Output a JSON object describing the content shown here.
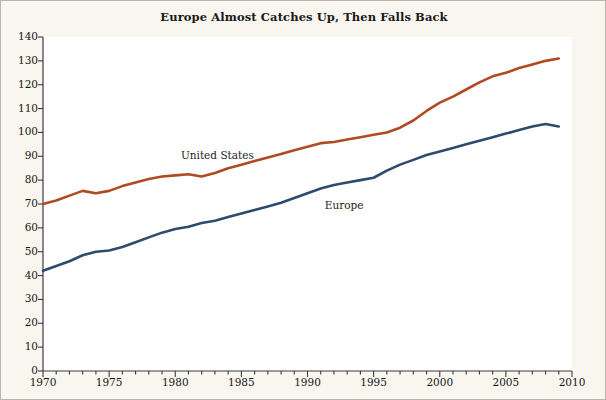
{
  "chart_data": {
    "type": "line",
    "title": "Europe Almost Catches Up, Then Falls Back",
    "xlabel": "",
    "ylabel": "",
    "xlim": [
      1970,
      2010
    ],
    "ylim": [
      0,
      140
    ],
    "ytick_step": 10,
    "xtick_step": 5,
    "x_minor_tick_step": 1,
    "grid": false,
    "legend": "inline-series-labels",
    "yticks": [
      0,
      10,
      20,
      30,
      40,
      50,
      60,
      70,
      80,
      90,
      100,
      110,
      120,
      130,
      140
    ],
    "xticks": [
      1970,
      1975,
      1980,
      1985,
      1990,
      1995,
      2000,
      2005,
      2010
    ],
    "x": [
      1970,
      1971,
      1972,
      1973,
      1974,
      1975,
      1976,
      1977,
      1978,
      1979,
      1980,
      1981,
      1982,
      1983,
      1984,
      1985,
      1986,
      1987,
      1988,
      1989,
      1990,
      1991,
      1992,
      1993,
      1994,
      1995,
      1996,
      1997,
      1998,
      1999,
      2000,
      2001,
      2002,
      2003,
      2004,
      2005,
      2006,
      2007,
      2008,
      2009
    ],
    "series": [
      {
        "name": "United States",
        "color": "#b04a22",
        "label_x": 1983,
        "label_y": 90,
        "values": [
          70,
          71.5,
          73.5,
          75.5,
          74.5,
          75.5,
          77.5,
          79,
          80.5,
          81.5,
          82,
          82.5,
          81.5,
          83,
          85,
          86.5,
          88,
          89.5,
          91,
          92.5,
          94,
          95.5,
          96,
          97,
          98,
          99,
          100,
          102,
          105,
          109,
          112.5,
          115,
          118,
          121,
          123.5,
          125,
          127,
          128.5,
          130,
          131
        ]
      },
      {
        "name": "Europe",
        "color": "#2e4a6d",
        "label_x": 1991,
        "label_y": 69,
        "values": [
          42,
          44,
          46,
          48.5,
          50,
          50.5,
          52,
          54,
          56,
          58,
          59.5,
          60.5,
          62,
          63,
          64.5,
          66,
          67.5,
          69,
          70.5,
          72.5,
          74.5,
          76.5,
          78,
          79,
          80,
          81,
          84,
          86.5,
          88.5,
          90.5,
          92,
          93.5,
          95,
          96.5,
          98,
          99.5,
          101,
          102.5,
          103.5,
          102.5
        ]
      }
    ]
  },
  "axes": {
    "y_tick_labels": [
      "140",
      "130",
      "120",
      "110",
      "100",
      "90",
      "80",
      "70",
      "60",
      "50",
      "40",
      "30",
      "20",
      "10",
      "0"
    ],
    "x_tick_labels": [
      "1970",
      "1975",
      "1980",
      "1985",
      "1990",
      "1995",
      "2000",
      "2005",
      "2010"
    ]
  },
  "labels": {
    "united_states": "United States",
    "europe": "Europe"
  }
}
